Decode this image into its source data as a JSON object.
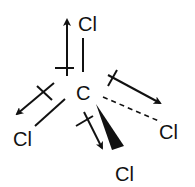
{
  "diagram": {
    "type": "molecular-structure",
    "molecule": "CCl4",
    "central_atom": {
      "symbol": "C"
    },
    "substituents": [
      {
        "id": "top",
        "symbol": "Cl",
        "bond": "single",
        "dipole_arrow": "up"
      },
      {
        "id": "left",
        "symbol": "Cl",
        "bond": "single",
        "dipole_arrow": "down-left"
      },
      {
        "id": "right",
        "symbol": "Cl",
        "bond": "dashed",
        "dipole_arrow": "down-right"
      },
      {
        "id": "bottom",
        "symbol": "Cl",
        "bond": "wedge",
        "dipole_arrow": "down"
      }
    ],
    "colors": {
      "ink": "#111111",
      "background": "#ffffff"
    }
  }
}
